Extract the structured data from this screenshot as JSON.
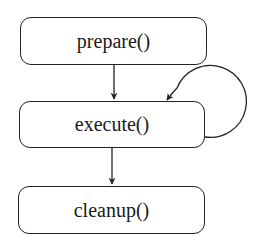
{
  "diagram": {
    "nodes": [
      {
        "id": "prepare",
        "label": "prepare()"
      },
      {
        "id": "execute",
        "label": "execute()"
      },
      {
        "id": "cleanup",
        "label": "cleanup()"
      }
    ],
    "edges": [
      {
        "from": "prepare",
        "to": "execute"
      },
      {
        "from": "execute",
        "to": "execute",
        "type": "self-loop"
      },
      {
        "from": "execute",
        "to": "cleanup"
      }
    ]
  }
}
